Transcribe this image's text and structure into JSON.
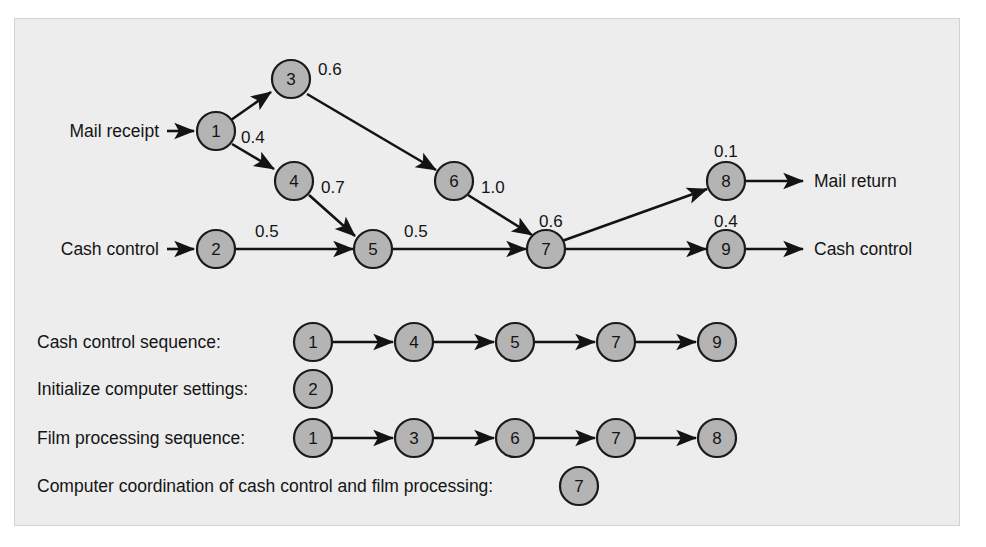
{
  "figure": {
    "panel_background": "#ededed",
    "node_fill": "#b4b4b4",
    "node_stroke": "#1a1a1a",
    "line_color": "#131313",
    "text_color": "#141414"
  },
  "network": {
    "inputs": [
      {
        "id": "mail-receipt",
        "label": "Mail receipt",
        "target_node": "1"
      },
      {
        "id": "cash-control-in",
        "label": "Cash control",
        "target_node": "2"
      }
    ],
    "outputs": [
      {
        "id": "mail-return",
        "label": "Mail return",
        "source_node": "8"
      },
      {
        "id": "cash-control-out",
        "label": "Cash control",
        "source_node": "9"
      }
    ],
    "nodes": [
      {
        "id": "1",
        "label": "1",
        "cx": 201,
        "cy": 112
      },
      {
        "id": "2",
        "label": "2",
        "cx": 201,
        "cy": 230
      },
      {
        "id": "3",
        "label": "3",
        "cx": 276,
        "cy": 60
      },
      {
        "id": "4",
        "label": "4",
        "cx": 279,
        "cy": 162
      },
      {
        "id": "5",
        "label": "5",
        "cx": 358,
        "cy": 230
      },
      {
        "id": "6",
        "label": "6",
        "cx": 439,
        "cy": 162
      },
      {
        "id": "7",
        "label": "7",
        "cx": 531,
        "cy": 230
      },
      {
        "id": "8",
        "label": "8",
        "cx": 711,
        "cy": 162
      },
      {
        "id": "9",
        "label": "9",
        "cx": 711,
        "cy": 230
      }
    ],
    "edges": [
      {
        "from": "1",
        "to": "3",
        "weight": "0.6",
        "wx": 305,
        "wy": 50
      },
      {
        "from": "1",
        "to": "4",
        "weight": "0.4",
        "wx": 228,
        "wy": 118
      },
      {
        "from": "3",
        "to": "6",
        "weight": "",
        "wx": 0,
        "wy": 0
      },
      {
        "from": "4",
        "to": "5",
        "weight": "0.7",
        "wx": 307,
        "wy": 168
      },
      {
        "from": "2",
        "to": "5",
        "weight": "0.5",
        "wx": 241,
        "wy": 212
      },
      {
        "from": "5",
        "to": "7",
        "weight": "0.5",
        "wx": 390,
        "wy": 212
      },
      {
        "from": "6",
        "to": "7",
        "weight": "1.0",
        "wx": 468,
        "wy": 168
      },
      {
        "from": "7",
        "to": "8",
        "weight": "0.6",
        "wx": 527,
        "wy": 206
      },
      {
        "from": "7",
        "to": "9",
        "weight": "0.4",
        "wx": 700,
        "wy": 206
      },
      {
        "from": "8",
        "to": "out",
        "weight": "0.1",
        "wx": 700,
        "wy": 136
      }
    ],
    "node_weight_labels": [
      {
        "node": "3",
        "value": "0.6"
      },
      {
        "node": "4",
        "value": "0.7"
      },
      {
        "node": "1",
        "value": "0.4"
      },
      {
        "node": "2",
        "value": "0.5"
      },
      {
        "node": "5",
        "value": "0.5"
      },
      {
        "node": "6",
        "value": "1.0"
      },
      {
        "node": "7",
        "value": "0.6"
      },
      {
        "node": "8",
        "value": "0.1"
      },
      {
        "node": "9",
        "value": "0.4"
      }
    ]
  },
  "sequences": [
    {
      "id": "cash-control-sequence",
      "label": "Cash control sequence:",
      "nodes": [
        "1",
        "4",
        "5",
        "7",
        "9"
      ],
      "label_x": 22,
      "label_y": 329,
      "start_x": 298,
      "y": 323,
      "spacing": 101
    },
    {
      "id": "initialize-computer-settings",
      "label": "Initialize computer settings:",
      "nodes": [
        "2"
      ],
      "label_x": 22,
      "label_y": 376,
      "start_x": 298,
      "y": 370,
      "spacing": 101
    },
    {
      "id": "film-processing-sequence",
      "label": "Film processing sequence:",
      "nodes": [
        "1",
        "3",
        "6",
        "7",
        "8"
      ],
      "label_x": 22,
      "label_y": 425,
      "start_x": 298,
      "y": 419,
      "spacing": 101
    },
    {
      "id": "computer-coordination",
      "label": "Computer coordination of cash control and film processing:",
      "nodes": [
        "7"
      ],
      "label_x": 22,
      "label_y": 473,
      "start_x": 564,
      "y": 467,
      "spacing": 101
    }
  ]
}
